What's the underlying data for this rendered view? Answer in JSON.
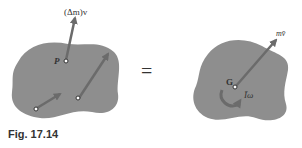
{
  "figure": {
    "caption": "Fig. 17.14",
    "left_panel": {
      "label_momentum": "(Δm)v",
      "label_point": "P"
    },
    "equals_sign": "=",
    "right_panel": {
      "label_linear_momentum": "mv̄",
      "label_center": "G",
      "label_angular_momentum": "Īω"
    },
    "colors": {
      "body_fill": "#8e8e8e",
      "arrow": "#6b6b6b",
      "text": "#333333"
    }
  }
}
